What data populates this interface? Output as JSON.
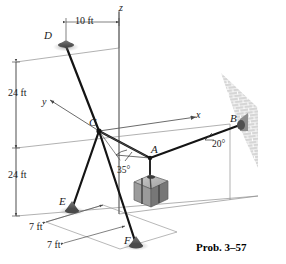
{
  "figure": {
    "caption": "Prob. 3–57",
    "axes": [
      {
        "name": "z",
        "label": "z",
        "x": 119,
        "y": 3
      },
      {
        "name": "y",
        "label": "y",
        "x": 42,
        "y": 97
      },
      {
        "name": "x",
        "label": "x",
        "x": 196,
        "y": 110
      }
    ],
    "points": [
      {
        "name": "D",
        "label": "D",
        "x": 44,
        "y": 30,
        "px": 66,
        "py": 46
      },
      {
        "name": "C",
        "label": "C",
        "x": 89,
        "y": 117,
        "px": 99,
        "py": 131
      },
      {
        "name": "A",
        "label": "A",
        "x": 151,
        "y": 144,
        "px": 150,
        "py": 158
      },
      {
        "name": "B",
        "label": "B",
        "x": 230,
        "y": 113,
        "px": 240,
        "py": 125
      },
      {
        "name": "E",
        "label": "E",
        "x": 59,
        "y": 196,
        "px": 72,
        "py": 209
      },
      {
        "name": "F",
        "label": "F",
        "x": 124,
        "y": 235,
        "px": 136,
        "py": 244
      }
    ],
    "dimensions": [
      {
        "name": "dim-10ft",
        "label": "10 ft",
        "x": 75,
        "y": 16
      },
      {
        "name": "dim-24ft-upper",
        "label": "24 ft",
        "x": 8,
        "y": 88
      },
      {
        "name": "dim-24ft-lower",
        "label": "24 ft",
        "x": 8,
        "y": 170
      },
      {
        "name": "dim-7ft-upper",
        "label": "7 ft",
        "x": 29,
        "y": 222
      },
      {
        "name": "dim-7ft-lower",
        "label": "7 ft",
        "x": 47,
        "y": 240
      }
    ],
    "angles": [
      {
        "name": "angle-35",
        "label": "35°",
        "x": 117,
        "y": 166
      },
      {
        "name": "angle-20",
        "label": "20°",
        "x": 212,
        "y": 140
      }
    ],
    "colors": {
      "cable": "#1a1a1a",
      "axis": "#6e6e6e",
      "wall": "#b9b9b9",
      "crate": "#a8a8a8",
      "anchor": "#6b6b6b"
    }
  }
}
